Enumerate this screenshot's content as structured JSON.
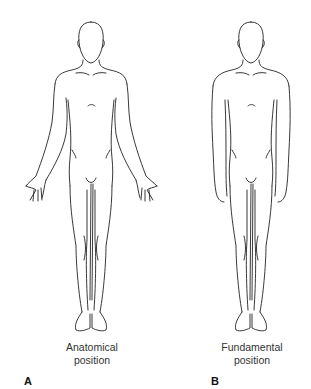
{
  "figures": [
    {
      "letter": "A",
      "caption_line1": "Anatomical",
      "caption_line2": "position"
    },
    {
      "letter": "B",
      "caption_line1": "Fundamental",
      "caption_line2": "position"
    }
  ],
  "colors": {
    "line": "#222222",
    "background": "#ffffff",
    "text": "#333333"
  }
}
